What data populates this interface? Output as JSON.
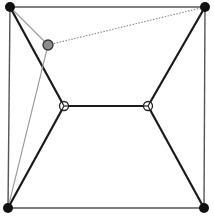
{
  "diagram": {
    "type": "graph",
    "width": 214,
    "height": 219,
    "colors": {
      "background": "#ffffff",
      "outer_edge": "#555555",
      "thick_edge": "#1a1a1a",
      "gray_edge": "#999999",
      "dotted_edge": "#888888",
      "black_node": "#111111",
      "gray_node_fill": "#8c8c8c",
      "gray_node_stroke": "#333333",
      "hollow_node_fill": "#ffffff",
      "hollow_node_stroke": "#222222"
    },
    "nodes": [
      {
        "id": "tl",
        "kind": "black",
        "x": 10,
        "y": 7,
        "r": 5
      },
      {
        "id": "tr",
        "kind": "black",
        "x": 205,
        "y": 7,
        "r": 5
      },
      {
        "id": "bl",
        "kind": "black",
        "x": 8,
        "y": 208,
        "r": 5
      },
      {
        "id": "br",
        "kind": "black",
        "x": 204,
        "y": 208,
        "r": 5
      },
      {
        "id": "g",
        "kind": "gray",
        "x": 48,
        "y": 45,
        "r": 5
      },
      {
        "id": "c1",
        "kind": "hollow",
        "x": 64,
        "y": 106,
        "r": 4.5
      },
      {
        "id": "c2",
        "kind": "hollow",
        "x": 148,
        "y": 106,
        "r": 4.5
      }
    ],
    "edges": [
      {
        "from": "tl",
        "to": "tr",
        "style": "outer"
      },
      {
        "from": "tr",
        "to": "br",
        "style": "outer"
      },
      {
        "from": "br",
        "to": "bl",
        "style": "outer"
      },
      {
        "from": "bl",
        "to": "tl",
        "style": "outer"
      },
      {
        "from": "tl",
        "to": "c1",
        "style": "thick"
      },
      {
        "from": "bl",
        "to": "c1",
        "style": "thick"
      },
      {
        "from": "tr",
        "to": "c2",
        "style": "thick"
      },
      {
        "from": "br",
        "to": "c2",
        "style": "thick"
      },
      {
        "from": "c1",
        "to": "c2",
        "style": "thick"
      },
      {
        "from": "tl",
        "to": "g",
        "style": "gray"
      },
      {
        "from": "g",
        "to": "bl",
        "style": "gray"
      },
      {
        "from": "g",
        "to": "tr",
        "style": "dotted"
      }
    ]
  }
}
